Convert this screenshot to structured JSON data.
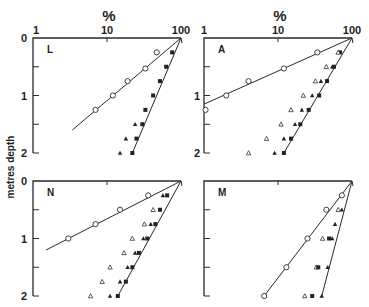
{
  "figure": {
    "y_label": "metres depth",
    "x_unit_label": "%",
    "x_tick_labels": [
      "1",
      "10",
      "100"
    ],
    "y_tick_labels": [
      "0",
      "1",
      "2"
    ]
  },
  "chart_data": {
    "type": "scatter",
    "title": "",
    "xlabel": "%",
    "ylabel": "metres depth",
    "xscale": "log",
    "xlim": [
      1,
      100
    ],
    "ylim": [
      0,
      2
    ],
    "y_inverted": true,
    "legend": "none",
    "grid": false,
    "panels": [
      {
        "label": "L",
        "show_x_ticklabels": true,
        "series": [
          {
            "name": "open circles",
            "marker": "circle-open",
            "points": [
              [
                47,
                0.25
              ],
              [
                33,
                0.53
              ],
              [
                19,
                0.75
              ],
              [
                12,
                1.0
              ],
              [
                7,
                1.25
              ]
            ],
            "fit_line": [
              [
                100,
                0
              ],
              [
                3.4,
                1.6
              ]
            ]
          },
          {
            "name": "filled squares",
            "marker": "square-filled",
            "points": [
              [
                76,
                0.25
              ],
              [
                63,
                0.5
              ],
              [
                52,
                0.75
              ],
              [
                42,
                1.0
              ],
              [
                33,
                1.25
              ],
              [
                30,
                1.5
              ],
              [
                25,
                1.75
              ],
              [
                22,
                2.0
              ]
            ],
            "fit_line": [
              [
                100,
                0
              ],
              [
                22,
                2.0
              ]
            ]
          },
          {
            "name": "filled triangles",
            "marker": "triangle-filled",
            "points": [
              [
                24,
                1.5
              ],
              [
                18,
                1.75
              ],
              [
                15,
                2.0
              ]
            ]
          }
        ]
      },
      {
        "label": "A",
        "show_x_ticklabels": true,
        "series": [
          {
            "name": "open circles",
            "marker": "circle-open",
            "points": [
              [
                34,
                0.25
              ],
              [
                12,
                0.53
              ],
              [
                4,
                0.75
              ],
              [
                2,
                1.0
              ],
              [
                1.05,
                1.25
              ]
            ],
            "fit_line": [
              [
                100,
                0
              ],
              [
                1,
                1.15
              ]
            ]
          },
          {
            "name": "filled squares",
            "marker": "square-filled",
            "points": [
              [
                69,
                0.25
              ],
              [
                57,
                0.5
              ],
              [
                46,
                0.75
              ],
              [
                36,
                1.0
              ],
              [
                26,
                1.25
              ],
              [
                20,
                1.5
              ],
              [
                15,
                1.75
              ],
              [
                12,
                2.0
              ]
            ],
            "fit_line": [
              [
                100,
                0
              ],
              [
                12,
                2.0
              ]
            ]
          },
          {
            "name": "filled triangles",
            "marker": "triangle-filled",
            "points": [
              [
                54,
                0.5
              ],
              [
                38,
                0.75
              ],
              [
                29,
                1.0
              ],
              [
                21,
                1.25
              ],
              [
                17,
                1.5
              ],
              [
                12,
                1.75
              ],
              [
                9,
                2.0
              ]
            ]
          },
          {
            "name": "open triangles",
            "marker": "triangle-open",
            "points": [
              [
                65,
                0.25
              ],
              [
                45,
                0.5
              ],
              [
                32,
                0.75
              ],
              [
                22,
                1.0
              ],
              [
                15,
                1.25
              ],
              [
                11,
                1.5
              ],
              [
                7,
                1.75
              ],
              [
                4,
                2.0
              ]
            ]
          }
        ]
      },
      {
        "label": "N",
        "show_x_ticklabels": false,
        "series": [
          {
            "name": "open circles",
            "marker": "circle-open",
            "points": [
              [
                36,
                0.25
              ],
              [
                15,
                0.5
              ],
              [
                7,
                0.75
              ],
              [
                3,
                1.0
              ]
            ],
            "fit_line": [
              [
                100,
                0
              ],
              [
                1.5,
                1.2
              ]
            ]
          },
          {
            "name": "filled squares",
            "marker": "square-filled",
            "points": [
              [
                65,
                0.25
              ],
              [
                52,
                0.5
              ],
              [
                45,
                0.75
              ],
              [
                35,
                1.0
              ],
              [
                27,
                1.25
              ],
              [
                22,
                1.5
              ],
              [
                18,
                1.75
              ],
              [
                14,
                2.0
              ]
            ],
            "fit_line": [
              [
                100,
                0
              ],
              [
                14,
                2.0
              ]
            ]
          },
          {
            "name": "filled triangles",
            "marker": "triangle-filled",
            "points": [
              [
                57,
                0.25
              ],
              [
                39,
                0.75
              ],
              [
                31,
                1.0
              ],
              [
                24,
                1.25
              ],
              [
                19,
                1.5
              ],
              [
                15,
                1.75
              ],
              [
                11,
                2.0
              ]
            ]
          },
          {
            "name": "open triangles",
            "marker": "triangle-open",
            "points": [
              [
                42,
                0.5
              ],
              [
                32,
                0.75
              ],
              [
                22,
                1.0
              ],
              [
                17,
                1.25
              ],
              [
                11,
                1.5
              ],
              [
                8.6,
                1.75
              ],
              [
                6,
                2.0
              ]
            ]
          }
        ]
      },
      {
        "label": "M",
        "show_x_ticklabels": false,
        "series": [
          {
            "name": "open circles",
            "marker": "circle-open",
            "points": [
              [
                73,
                0.25
              ],
              [
                45,
                0.5
              ],
              [
                25,
                1.0
              ],
              [
                13,
                1.5
              ],
              [
                6.5,
                2.0
              ]
            ],
            "fit_line": [
              [
                100,
                0
              ],
              [
                6.5,
                2.0
              ]
            ]
          },
          {
            "name": "filled triangles",
            "marker": "triangle-filled",
            "points": [
              [
                73,
                0.5
              ],
              [
                59,
                0.75
              ],
              [
                54,
                1.0
              ],
              [
                47,
                1.5
              ],
              [
                39,
                2.0
              ]
            ],
            "fit_line": [
              [
                100,
                0
              ],
              [
                39,
                2.0
              ]
            ]
          },
          {
            "name": "open triangles",
            "marker": "triangle-open",
            "points": [
              [
                65,
                0.5
              ],
              [
                40,
                1.0
              ],
              [
                33,
                1.5
              ],
              [
                23,
                2.0
              ]
            ]
          },
          {
            "name": "filled squares",
            "marker": "square-filled",
            "points": [
              [
                49,
                1.0
              ],
              [
                35,
                1.5
              ],
              [
                29,
                2.0
              ]
            ]
          }
        ]
      }
    ]
  },
  "layout": {
    "panels": [
      {
        "x0": 33,
        "x1": 181,
        "y0": 38,
        "y1": 153
      },
      {
        "x0": 204,
        "x1": 352,
        "y0": 38,
        "y1": 153
      },
      {
        "x0": 33,
        "x1": 181,
        "y0": 181,
        "y1": 296
      },
      {
        "x0": 204,
        "x1": 352,
        "y0": 181,
        "y1": 296
      }
    ]
  }
}
